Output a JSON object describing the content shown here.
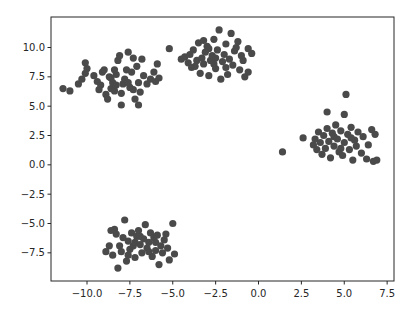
{
  "chart_data": {
    "type": "scatter",
    "title": "",
    "xlabel": "",
    "ylabel": "",
    "xlim": [
      -12.1,
      7.9
    ],
    "ylim": [
      -9.9,
      12.6
    ],
    "grid": false,
    "legend": null,
    "marker_color": "#4a4a4a",
    "marker_radius": 3.6,
    "x_ticks": [
      -10.0,
      -7.5,
      -5.0,
      -2.5,
      0.0,
      2.5,
      5.0,
      7.5
    ],
    "x_tick_labels": [
      "−10.0",
      "−7.5",
      "−5.0",
      "−2.5",
      "0.0",
      "2.5",
      "5.0",
      "7.5"
    ],
    "y_ticks": [
      -7.5,
      -5.0,
      -2.5,
      0.0,
      2.5,
      5.0,
      7.5,
      10.0
    ],
    "y_tick_labels": [
      "−7.5",
      "−5.0",
      "−2.5",
      "0.0",
      "2.5",
      "5.0",
      "7.5",
      "10.0"
    ],
    "series": [
      {
        "name": "cluster-1",
        "center": [
          -8.0,
          7.1
        ],
        "points": [
          [
            -11.4,
            6.5
          ],
          [
            -11.0,
            6.3
          ],
          [
            -10.5,
            6.9
          ],
          [
            -10.3,
            7.3
          ],
          [
            -10.1,
            7.8
          ],
          [
            -10.0,
            8.2
          ],
          [
            -10.1,
            8.7
          ],
          [
            -9.4,
            7.1
          ],
          [
            -9.2,
            6.8
          ],
          [
            -9.1,
            7.9
          ],
          [
            -9.0,
            8.1
          ],
          [
            -8.9,
            6.0
          ],
          [
            -8.8,
            5.6
          ],
          [
            -8.7,
            7.5
          ],
          [
            -8.6,
            6.5
          ],
          [
            -8.5,
            7.0
          ],
          [
            -8.4,
            6.3
          ],
          [
            -8.3,
            7.7
          ],
          [
            -8.2,
            8.9
          ],
          [
            -8.1,
            9.3
          ],
          [
            -8.0,
            5.1
          ],
          [
            -7.9,
            6.9
          ],
          [
            -7.8,
            7.3
          ],
          [
            -7.7,
            8.1
          ],
          [
            -7.6,
            9.6
          ],
          [
            -7.5,
            6.6
          ],
          [
            -7.4,
            7.9
          ],
          [
            -7.3,
            9.1
          ],
          [
            -7.2,
            5.6
          ],
          [
            -7.1,
            8.4
          ],
          [
            -7.0,
            5.1
          ],
          [
            -7.0,
            7.0
          ],
          [
            -6.9,
            6.2
          ],
          [
            -6.7,
            7.6
          ],
          [
            -6.5,
            6.9
          ],
          [
            -6.3,
            7.3
          ],
          [
            -6.1,
            7.9
          ],
          [
            -6.0,
            7.1
          ],
          [
            -5.8,
            7.4
          ],
          [
            -8.6,
            7.4
          ],
          [
            -8.0,
            6.1
          ],
          [
            -9.3,
            6.4
          ],
          [
            -7.6,
            7.0
          ],
          [
            -8.3,
            6.8
          ],
          [
            -7.3,
            6.4
          ],
          [
            -6.8,
            9.0
          ],
          [
            -8.4,
            8.1
          ],
          [
            -9.6,
            7.6
          ]
        ]
      },
      {
        "name": "cluster-2",
        "center": [
          -2.6,
          9.2
        ],
        "points": [
          [
            -5.9,
            8.6
          ],
          [
            -5.2,
            9.9
          ],
          [
            -4.5,
            9.0
          ],
          [
            -4.3,
            9.2
          ],
          [
            -4.1,
            8.7
          ],
          [
            -4.0,
            9.4
          ],
          [
            -3.9,
            8.3
          ],
          [
            -3.8,
            9.8
          ],
          [
            -3.6,
            8.9
          ],
          [
            -3.5,
            10.4
          ],
          [
            -3.4,
            7.8
          ],
          [
            -3.3,
            9.1
          ],
          [
            -3.2,
            8.6
          ],
          [
            -3.1,
            9.6
          ],
          [
            -3.0,
            10.1
          ],
          [
            -2.9,
            7.6
          ],
          [
            -2.8,
            8.9
          ],
          [
            -2.7,
            9.3
          ],
          [
            -2.6,
            10.7
          ],
          [
            -2.5,
            8.2
          ],
          [
            -2.4,
            9.8
          ],
          [
            -2.3,
            11.5
          ],
          [
            -2.2,
            7.3
          ],
          [
            -2.1,
            8.8
          ],
          [
            -2.0,
            9.4
          ],
          [
            -1.9,
            10.3
          ],
          [
            -1.8,
            7.7
          ],
          [
            -1.7,
            9.0
          ],
          [
            -1.6,
            11.2
          ],
          [
            -1.5,
            8.5
          ],
          [
            -1.4,
            9.7
          ],
          [
            -1.3,
            10.0
          ],
          [
            -1.1,
            8.1
          ],
          [
            -1.0,
            9.3
          ],
          [
            -0.9,
            8.9
          ],
          [
            -0.8,
            7.5
          ],
          [
            -0.6,
            9.9
          ],
          [
            -0.4,
            9.5
          ],
          [
            -0.6,
            7.9
          ],
          [
            -2.5,
            9.1
          ],
          [
            -2.9,
            9.9
          ],
          [
            -3.7,
            8.4
          ],
          [
            -1.9,
            8.3
          ],
          [
            -1.2,
            10.5
          ],
          [
            -2.6,
            8.6
          ],
          [
            -3.2,
            10.6
          ]
        ]
      },
      {
        "name": "cluster-3",
        "center": [
          4.6,
          2.2
        ],
        "points": [
          [
            1.4,
            1.1
          ],
          [
            2.6,
            2.3
          ],
          [
            3.2,
            1.7
          ],
          [
            3.4,
            1.3
          ],
          [
            3.5,
            2.8
          ],
          [
            3.6,
            1.9
          ],
          [
            3.7,
            0.9
          ],
          [
            3.8,
            2.5
          ],
          [
            3.9,
            1.4
          ],
          [
            4.0,
            3.1
          ],
          [
            4.1,
            2.0
          ],
          [
            4.2,
            0.6
          ],
          [
            4.3,
            2.7
          ],
          [
            4.4,
            1.6
          ],
          [
            4.5,
            3.4
          ],
          [
            4.6,
            2.2
          ],
          [
            4.7,
            1.1
          ],
          [
            4.8,
            2.9
          ],
          [
            4.9,
            0.8
          ],
          [
            5.0,
            4.3
          ],
          [
            5.0,
            1.9
          ],
          [
            5.1,
            6.0
          ],
          [
            5.2,
            2.6
          ],
          [
            5.3,
            1.3
          ],
          [
            5.4,
            3.2
          ],
          [
            5.5,
            0.4
          ],
          [
            5.6,
            2.1
          ],
          [
            5.7,
            1.6
          ],
          [
            5.8,
            2.8
          ],
          [
            6.0,
            1.0
          ],
          [
            6.1,
            2.4
          ],
          [
            6.3,
            0.5
          ],
          [
            6.4,
            1.7
          ],
          [
            6.6,
            3.0
          ],
          [
            6.7,
            0.3
          ],
          [
            6.8,
            2.6
          ],
          [
            6.9,
            0.4
          ],
          [
            4.0,
            4.5
          ],
          [
            3.3,
            2.2
          ],
          [
            4.4,
            2.4
          ],
          [
            5.4,
            2.3
          ],
          [
            4.8,
            1.4
          ]
        ]
      },
      {
        "name": "cluster-4",
        "center": [
          -6.8,
          -6.6
        ],
        "points": [
          [
            -8.9,
            -7.4
          ],
          [
            -8.7,
            -6.9
          ],
          [
            -8.5,
            -7.7
          ],
          [
            -8.4,
            -5.5
          ],
          [
            -8.3,
            -5.9
          ],
          [
            -8.2,
            -8.8
          ],
          [
            -8.1,
            -6.9
          ],
          [
            -8.0,
            -7.4
          ],
          [
            -7.9,
            -6.2
          ],
          [
            -7.8,
            -4.7
          ],
          [
            -7.7,
            -8.2
          ],
          [
            -7.6,
            -6.5
          ],
          [
            -7.5,
            -7.2
          ],
          [
            -7.4,
            -5.8
          ],
          [
            -7.3,
            -6.9
          ],
          [
            -7.2,
            -7.9
          ],
          [
            -7.1,
            -6.1
          ],
          [
            -7.0,
            -5.6
          ],
          [
            -6.9,
            -6.8
          ],
          [
            -6.8,
            -7.5
          ],
          [
            -6.7,
            -6.3
          ],
          [
            -6.6,
            -5.1
          ],
          [
            -6.5,
            -7.1
          ],
          [
            -6.4,
            -6.6
          ],
          [
            -6.3,
            -5.8
          ],
          [
            -6.2,
            -7.8
          ],
          [
            -6.1,
            -6.2
          ],
          [
            -6.0,
            -7.3
          ],
          [
            -5.9,
            -6.0
          ],
          [
            -5.8,
            -8.5
          ],
          [
            -5.7,
            -6.9
          ],
          [
            -5.6,
            -7.5
          ],
          [
            -5.5,
            -6.4
          ],
          [
            -5.4,
            -5.9
          ],
          [
            -5.3,
            -7.1
          ],
          [
            -5.2,
            -8.1
          ],
          [
            -5.0,
            -5.0
          ],
          [
            -4.9,
            -7.6
          ],
          [
            -6.9,
            -6.1
          ],
          [
            -7.2,
            -6.6
          ],
          [
            -6.4,
            -7.4
          ],
          [
            -7.6,
            -7.7
          ],
          [
            -6.0,
            -6.6
          ],
          [
            -8.6,
            -5.6
          ]
        ]
      }
    ]
  },
  "layout": {
    "plot_left": 51,
    "plot_right": 394,
    "plot_top": 17,
    "plot_bottom": 281
  }
}
